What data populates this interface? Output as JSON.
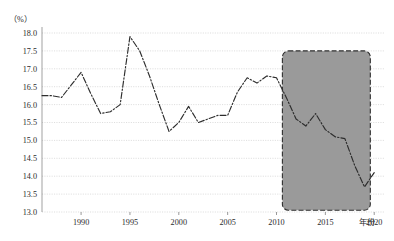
{
  "chart_data": {
    "type": "line",
    "title": "",
    "subtitle": "",
    "xlabel": "年份",
    "ylabel": "（%）",
    "ylim": [
      13.0,
      18.0
    ],
    "xlim": [
      1986,
      2021
    ],
    "grid": true,
    "legend": null,
    "ytick_labels": [
      "18.0",
      "17.5",
      "17.0",
      "16.5",
      "16.0",
      "15.5",
      "15.0",
      "14.5",
      "14.0",
      "13.5",
      "13.0"
    ],
    "ytick_values": [
      18.0,
      17.5,
      17.0,
      16.5,
      16.0,
      15.5,
      15.0,
      14.5,
      14.0,
      13.5,
      13.0
    ],
    "xtick_labels": [
      "1990",
      "1995",
      "2000",
      "2005",
      "2010",
      "2015",
      "2020"
    ],
    "xtick_values": [
      1990,
      1995,
      2000,
      2005,
      2010,
      2015,
      2020
    ],
    "x": [
      1986,
      1987,
      1988,
      1989,
      1990,
      1991,
      1992,
      1993,
      1994,
      1995,
      1996,
      1997,
      1998,
      1999,
      2000,
      2001,
      2002,
      2003,
      2004,
      2005,
      2006,
      2007,
      2008,
      2009,
      2010,
      2011,
      2012,
      2013,
      2014,
      2015,
      2016,
      2017,
      2018,
      2019,
      2020
    ],
    "values": [
      16.25,
      16.25,
      16.2,
      16.55,
      16.9,
      16.3,
      15.75,
      15.8,
      16.0,
      17.9,
      17.5,
      16.8,
      16.0,
      15.25,
      15.5,
      15.95,
      15.5,
      15.6,
      15.7,
      15.7,
      16.35,
      16.75,
      16.6,
      16.8,
      16.75,
      16.2,
      15.6,
      15.4,
      15.75,
      15.3,
      15.1,
      15.05,
      14.3,
      13.7,
      14.1
    ],
    "annotations": [
      {
        "name": "highlight-region",
        "type": "shaded-rect",
        "x_start": 2010.6,
        "x_end": 2019.6,
        "y_start": 13.05,
        "y_end": 17.5,
        "color": "#9a9a9a",
        "border": "dashed"
      }
    ],
    "series_style": {
      "line_color": "#2d2d2d",
      "line_style": "dash-dot-dot",
      "markers": false
    }
  },
  "axis": {
    "y_axis_title": "（%）",
    "x_axis_title": "年份"
  }
}
